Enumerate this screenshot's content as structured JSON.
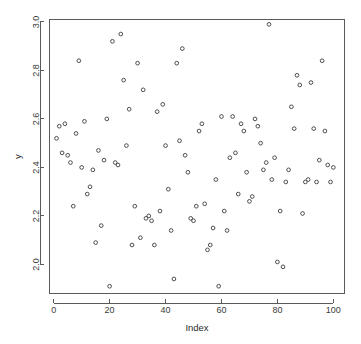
{
  "chart_data": {
    "type": "scatter",
    "title": "",
    "xlabel": "Index",
    "ylabel": "y",
    "xlim": [
      -1.5,
      104
    ],
    "ylim": [
      1.88,
      3.01
    ],
    "grid": false,
    "legend": "none",
    "marker": "open-circle",
    "marker_color": "#4d4d4d",
    "xticks": [
      0,
      20,
      40,
      60,
      80,
      100
    ],
    "xtick_labels": [
      "0",
      "20",
      "40",
      "60",
      "80",
      "100"
    ],
    "yticks": [
      2.0,
      2.2,
      2.4,
      2.6,
      2.8,
      3.0
    ],
    "ytick_labels": [
      "2.0",
      "2.2",
      "2.4",
      "2.6",
      "2.8",
      "3.0"
    ],
    "n_points": 100,
    "x": [
      1,
      2,
      3,
      4,
      5,
      6,
      7,
      8,
      9,
      10,
      11,
      12,
      13,
      14,
      15,
      16,
      17,
      18,
      19,
      20,
      21,
      22,
      23,
      24,
      25,
      26,
      27,
      28,
      29,
      30,
      31,
      32,
      33,
      34,
      35,
      36,
      37,
      38,
      39,
      40,
      41,
      42,
      43,
      44,
      45,
      46,
      47,
      48,
      49,
      50,
      51,
      52,
      53,
      54,
      55,
      56,
      57,
      58,
      59,
      60,
      61,
      62,
      63,
      64,
      65,
      66,
      67,
      68,
      69,
      70,
      71,
      72,
      73,
      74,
      75,
      76,
      77,
      78,
      79,
      80,
      81,
      82,
      83,
      84,
      85,
      86,
      87,
      88,
      89,
      90,
      91,
      92,
      93,
      94,
      95,
      96,
      97,
      98,
      99,
      100
    ],
    "y": [
      2.52,
      2.57,
      2.46,
      2.58,
      2.45,
      2.42,
      2.24,
      2.54,
      2.84,
      2.4,
      2.59,
      2.29,
      2.32,
      2.39,
      2.09,
      2.47,
      2.16,
      2.43,
      2.6,
      1.91,
      2.92,
      2.42,
      2.41,
      2.95,
      2.76,
      2.49,
      2.64,
      2.08,
      2.24,
      2.83,
      2.11,
      2.72,
      2.19,
      2.2,
      2.18,
      2.08,
      2.63,
      2.22,
      2.66,
      2.49,
      2.31,
      2.14,
      1.94,
      2.83,
      2.51,
      2.89,
      2.45,
      2.38,
      2.19,
      2.18,
      2.24,
      2.55,
      2.58,
      2.25,
      2.06,
      2.08,
      2.15,
      2.35,
      1.91,
      2.61,
      2.22,
      2.14,
      2.44,
      2.61,
      2.46,
      2.29,
      2.58,
      2.55,
      2.38,
      2.26,
      2.28,
      2.6,
      2.57,
      2.5,
      2.39,
      2.42,
      2.99,
      2.35,
      2.44,
      2.01,
      2.22,
      1.99,
      2.34,
      2.39,
      2.65,
      2.56,
      2.78,
      2.74,
      2.21,
      2.34,
      2.35,
      2.75,
      2.56,
      2.34,
      2.43,
      2.84,
      2.55,
      2.41,
      2.34,
      2.4
    ]
  },
  "axes": {
    "x_title": "Index",
    "y_title": "y"
  }
}
